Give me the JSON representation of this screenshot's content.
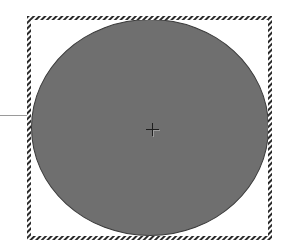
{
  "canvas": {
    "background": "#ffffff"
  },
  "connector": {
    "color": "#9a9a9a"
  },
  "shape": {
    "type": "ellipse",
    "fill": "#6f6f6f",
    "stroke": "#3a3a3a",
    "selected": true
  },
  "selection": {
    "style": "hatched",
    "color": "#2a2a2a"
  },
  "center_handle": {
    "icon": "crosshair-icon"
  }
}
